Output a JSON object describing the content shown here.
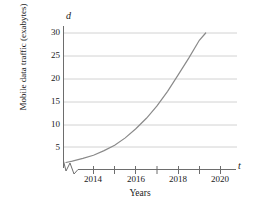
{
  "chart_data": {
    "type": "line",
    "title": "",
    "xlabel": "Years",
    "ylabel": "Mobile data traffic (exabytes)",
    "x_axis_variable": "t",
    "y_axis_variable": "d",
    "xlim": [
      2012.6,
      2020.9
    ],
    "ylim": [
      0,
      32
    ],
    "xticks": [
      2014,
      2016,
      2018,
      2020
    ],
    "xtick_labels": [
      "2014",
      "2016",
      "2018",
      "2020"
    ],
    "minor_xticks": [
      2013,
      2015,
      2017,
      2019
    ],
    "yticks": [
      5,
      10,
      15,
      20,
      25,
      30
    ],
    "ytick_labels": [
      "5",
      "10",
      "15",
      "20",
      "25",
      "30"
    ],
    "grid": "horizontal",
    "legend": "none",
    "axis_break": "zigzag on x-axis near origin",
    "series": [
      {
        "name": "Mobile data traffic",
        "x": [
          2012.7,
          2013.0,
          2013.5,
          2014.0,
          2014.5,
          2015.0,
          2015.5,
          2016.0,
          2016.5,
          2017.0,
          2017.5,
          2018.0,
          2018.5,
          2019.0,
          2019.3
        ],
        "values": [
          1.6,
          1.9,
          2.5,
          3.2,
          4.2,
          5.4,
          7.0,
          9.0,
          11.3,
          14.0,
          17.2,
          20.8,
          24.5,
          28.4,
          30.0
        ]
      }
    ]
  },
  "labels": {
    "y_axis_title": "Mobile data traffic (exabytes)",
    "x_axis_title": "Years",
    "dependent_variable": "d",
    "independent_variable": "t"
  },
  "colors": {
    "curve": "#8a8a8a",
    "gridline": "#d2d2d2",
    "axis": "#6d6d6d",
    "text": "#1a1a1a",
    "background": "#ffffff"
  }
}
